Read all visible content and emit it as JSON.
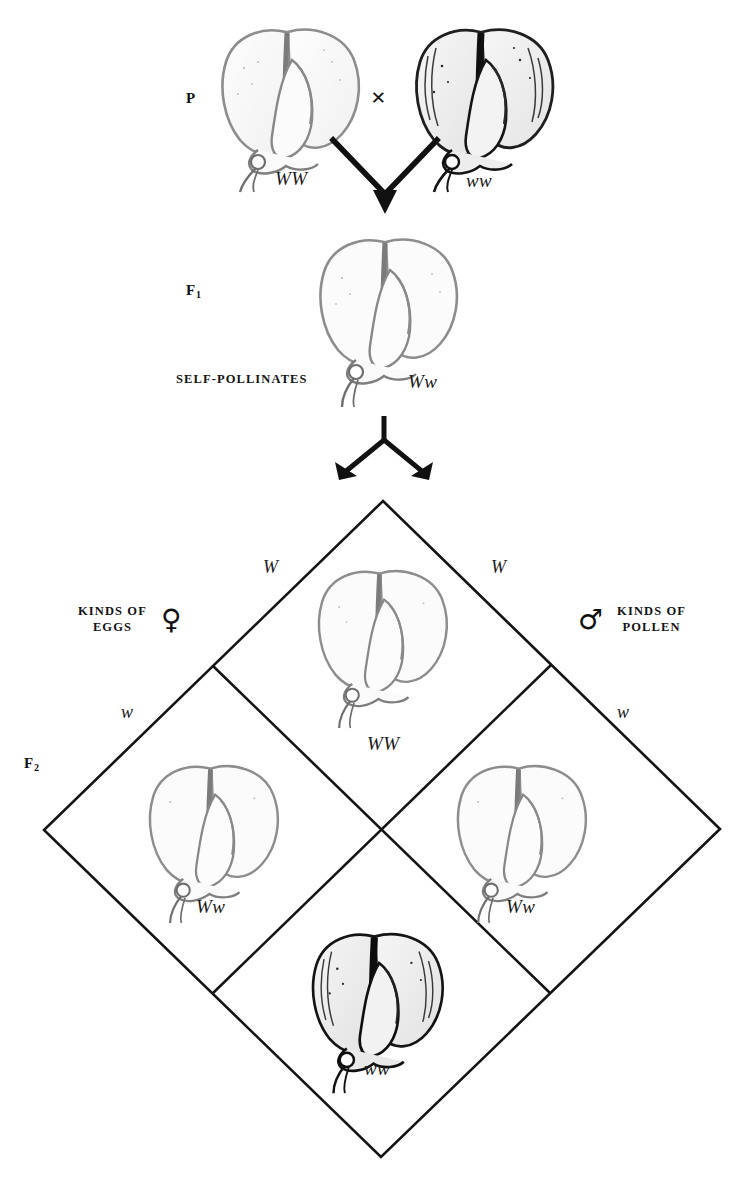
{
  "figure": {
    "type": "genetics-punnett-diagram",
    "ink_color": "#1a1a1a",
    "background_color": "#ffffff"
  },
  "generations": {
    "parental": {
      "label": "P",
      "cross_symbol": "×",
      "parents": [
        {
          "genotype": "WW",
          "phenotype": "white-flower",
          "shade": "light"
        },
        {
          "genotype": "ww",
          "phenotype": "dark-flower",
          "shade": "dark"
        }
      ]
    },
    "f1": {
      "label": "F",
      "subscript": "1",
      "note": "SELF-POLLINATES",
      "offspring": [
        {
          "genotype": "Ww",
          "phenotype": "white-flower",
          "shade": "light"
        }
      ]
    },
    "f2": {
      "label": "F",
      "subscript": "2"
    }
  },
  "punnett": {
    "left_axis": {
      "title_line1": "KINDS OF",
      "title_line2": "EGGS",
      "symbol": "♀",
      "symbol_name": "female-symbol",
      "gametes": [
        "W",
        "w"
      ]
    },
    "right_axis": {
      "title_line1": "KINDS OF",
      "title_line2": "POLLEN",
      "symbol": "♂",
      "symbol_name": "male-symbol",
      "gametes": [
        "W",
        "w"
      ]
    },
    "cells": [
      {
        "position": "top",
        "genotype": "WW",
        "phenotype": "white-flower",
        "shade": "light"
      },
      {
        "position": "left",
        "genotype": "Ww",
        "phenotype": "white-flower",
        "shade": "light"
      },
      {
        "position": "right",
        "genotype": "Ww",
        "phenotype": "white-flower",
        "shade": "light"
      },
      {
        "position": "bottom",
        "genotype": "ww",
        "phenotype": "dark-flower",
        "shade": "dark"
      }
    ]
  },
  "arrows": {
    "p_to_f1": "converging-down-arrow",
    "f1_to_f2": "diverging-down-arrow"
  }
}
